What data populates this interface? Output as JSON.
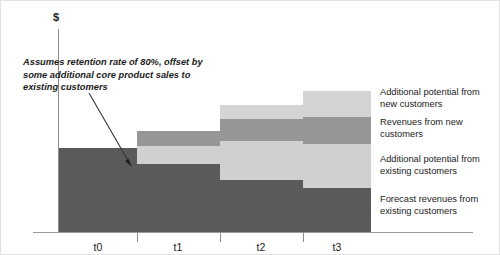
{
  "chart_data": {
    "type": "bar",
    "title": "",
    "subtitle": "",
    "xlabel": "",
    "ylabel": "$",
    "stacked": true,
    "grid": false,
    "legend_position": "right",
    "categories": [
      "t0",
      "t1",
      "t2",
      "t3"
    ],
    "series": [
      {
        "name": "Forecast revenues from existing customers",
        "color": "#5a5a5a",
        "values": [
          84,
          68,
          56,
          45
        ]
      },
      {
        "name": "Additional potential from existing customers",
        "color": "#d0d0d0",
        "values": [
          0,
          18,
          39,
          54
        ]
      },
      {
        "name": "Revenues from new customers",
        "color": "#969696",
        "values": [
          0,
          15,
          22,
          27
        ]
      },
      {
        "name": "Additional potential from new customers",
        "color": "#d4d4d4",
        "values": [
          0,
          0,
          14,
          26
        ]
      }
    ],
    "annotations": [
      {
        "text": "Assumes retention rate of 80%, offset by some additional core product sales to existing customers",
        "target_category": "t0"
      }
    ]
  },
  "axis": {
    "y_label": "$",
    "ticks": [
      "t0",
      "t1",
      "t2",
      "t3"
    ]
  },
  "annotation": {
    "text": "Assumes retention rate of 80%, offset by some additional core product sales to existing customers"
  },
  "legend": {
    "items": [
      {
        "label": "Additional potential from new customers"
      },
      {
        "label": "Revenues from new customers"
      },
      {
        "label": "Additional potential from existing customers"
      },
      {
        "label": "Forecast revenues from existing customers"
      }
    ]
  },
  "colors": {
    "dark_gray": "#5a5a5a",
    "medium_gray": "#969696",
    "light_gray": "#d0d0d0",
    "lightest_gray": "#d4d4d4",
    "axis": "#8d8d8d",
    "text": "#1b1b1b",
    "background": "#ffffff"
  },
  "layout": {
    "bars": [
      {
        "category": "t0",
        "x": 58,
        "width": 78,
        "segments": [
          {
            "series": "Forecast revenues from existing customers",
            "top": 147,
            "height": 84,
            "color": "#5a5a5a"
          }
        ]
      },
      {
        "category": "t1",
        "x": 136,
        "width": 83,
        "segments": [
          {
            "series": "Revenues from new customers",
            "top": 130,
            "height": 15,
            "color": "#969696"
          },
          {
            "series": "Additional potential from existing customers",
            "top": 145,
            "height": 18,
            "color": "#d0d0d0"
          },
          {
            "series": "Forecast revenues from existing customers",
            "top": 163,
            "height": 68,
            "color": "#5a5a5a"
          }
        ]
      },
      {
        "category": "t2",
        "x": 219,
        "width": 83,
        "segments": [
          {
            "series": "Additional potential from new customers",
            "top": 104,
            "height": 14,
            "color": "#d4d4d4"
          },
          {
            "series": "Revenues from new customers",
            "top": 118,
            "height": 22,
            "color": "#969696"
          },
          {
            "series": "Additional potential from existing customers",
            "top": 140,
            "height": 39,
            "color": "#d0d0d0"
          },
          {
            "series": "Forecast revenues from existing customers",
            "top": 179,
            "height": 52,
            "color": "#5a5a5a"
          }
        ]
      },
      {
        "category": "t3",
        "x": 302,
        "width": 68,
        "segments": [
          {
            "series": "Additional potential from new customers",
            "top": 90,
            "height": 26,
            "color": "#d4d4d4"
          },
          {
            "series": "Revenues from new customers",
            "top": 116,
            "height": 27,
            "color": "#969696"
          },
          {
            "series": "Additional potential from existing customers",
            "top": 143,
            "height": 44,
            "color": "#d0d0d0"
          },
          {
            "series": "Forecast revenues from existing customers",
            "top": 187,
            "height": 44,
            "color": "#5a5a5a"
          }
        ]
      }
    ],
    "ticks_x": [
      136,
      219,
      302
    ],
    "tick_label_x": [
      97,
      177,
      260,
      336
    ],
    "legend_tops": [
      85,
      115,
      152,
      192
    ]
  }
}
